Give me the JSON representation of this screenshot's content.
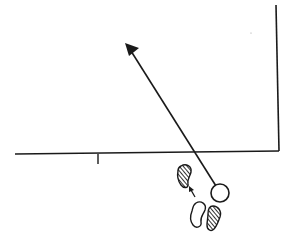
{
  "diagram": {
    "type": "line-drawing",
    "colors": {
      "stroke": "#1a1a1a",
      "background": "#ffffff",
      "fill_white": "#ffffff"
    },
    "elements": {
      "horizontal_wall": {
        "x1": 15,
        "y1": 154,
        "x2": 279,
        "y2": 151
      },
      "vertical_wall": {
        "x1": 276,
        "y1": 5,
        "x2": 279,
        "y2": 151
      },
      "tick_mark": {
        "x": 98,
        "y1": 154,
        "y2": 164
      },
      "trajectory_arrow": {
        "x1": 216,
        "y1": 186,
        "x2": 130,
        "y2": 50
      },
      "circle": {
        "cx": 220,
        "cy": 193,
        "r": 9
      },
      "step_arrow": {
        "x1": 195,
        "y1": 198,
        "x2": 190,
        "y2": 188
      }
    }
  }
}
